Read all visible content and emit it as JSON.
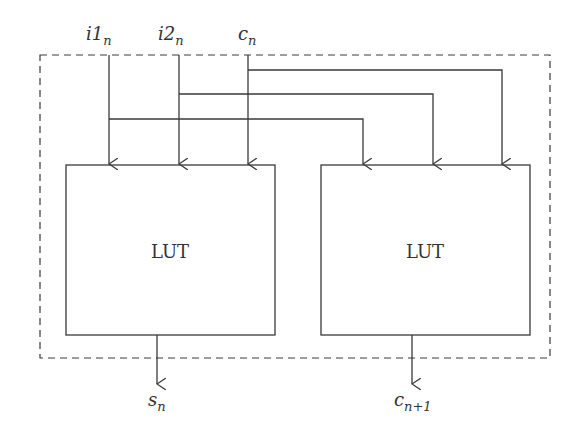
{
  "diagram": {
    "inputs": [
      {
        "id": "i1",
        "base": "i1",
        "sub": "n"
      },
      {
        "id": "i2",
        "base": "i2",
        "sub": "n"
      },
      {
        "id": "c",
        "base": "c",
        "sub": "n"
      }
    ],
    "blocks": [
      {
        "id": "lut-left",
        "label": "LUT"
      },
      {
        "id": "lut-right",
        "label": "LUT"
      }
    ],
    "outputs": [
      {
        "id": "s",
        "base": "s",
        "sub": "n"
      },
      {
        "id": "cout",
        "base": "c",
        "sub": "n+1"
      }
    ],
    "colors": {
      "line": "#3a3a3a",
      "background": "#ffffff"
    }
  }
}
